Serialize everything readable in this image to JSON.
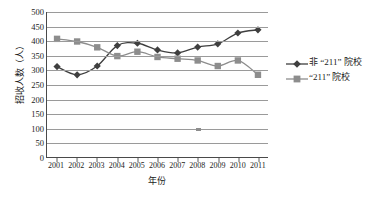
{
  "chart_data": {
    "type": "line",
    "title": "",
    "xlabel": "年份",
    "ylabel": "招收人数（人）",
    "categories": [
      "2001",
      "2002",
      "2003",
      "2004",
      "2005",
      "2006",
      "2007",
      "2008",
      "2009",
      "2010",
      "2011"
    ],
    "ylim": [
      0,
      500
    ],
    "ytick_step": 50,
    "yticks": [
      "500",
      "450",
      "400",
      "350",
      "300",
      "250",
      "200",
      "150",
      "100",
      "50",
      "0"
    ],
    "grid": true,
    "legend_position": "right",
    "series": [
      {
        "name": "非 “211” 院校",
        "marker": "diamond",
        "color": "#3f3f3f",
        "values": [
          313,
          285,
          315,
          385,
          393,
          370,
          360,
          380,
          391,
          428,
          439
        ]
      },
      {
        "name": "“211” 院校",
        "marker": "square",
        "color": "#8d8d8d",
        "values": [
          408,
          399,
          379,
          349,
          364,
          346,
          340,
          334,
          315,
          334,
          285
        ]
      }
    ],
    "annotations": [
      {
        "name": "stray-mark",
        "x_category": "2008",
        "y_value": 97
      }
    ]
  },
  "caption": ""
}
